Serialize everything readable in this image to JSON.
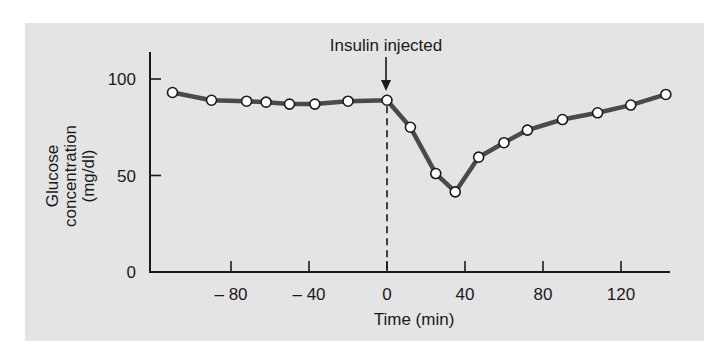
{
  "chart_data": {
    "type": "line",
    "title": "",
    "xlabel": "Time (min)",
    "ylabel": [
      "Glucose",
      "concentration",
      "(mg/dl)"
    ],
    "xlim": [
      -118,
      145
    ],
    "ylim": [
      0,
      117
    ],
    "x_ticks": [
      -80,
      -40,
      0,
      40,
      80,
      120
    ],
    "x_tick_labels": [
      "– 80",
      "– 40",
      "0",
      "40",
      "80",
      "120"
    ],
    "y_ticks": [
      0,
      50,
      100
    ],
    "y_tick_labels": [
      "0",
      "50",
      "100"
    ],
    "grid": false,
    "legend": null,
    "annotations": [
      {
        "text": "Insulin injected",
        "x": 0,
        "type": "arrow + dashed vertical line"
      }
    ],
    "series": [
      {
        "name": "Glucose concentration",
        "marker": "open-circle",
        "x": [
          -110,
          -90,
          -72,
          -62,
          -50,
          -37,
          -20,
          0,
          12,
          25,
          35,
          47,
          60,
          72,
          90,
          108,
          125,
          143
        ],
        "values": [
          93,
          89,
          88.5,
          88,
          87,
          87,
          88.5,
          89,
          75,
          51,
          41.5,
          59.5,
          67,
          73.5,
          79,
          82.5,
          86.5,
          92
        ]
      }
    ]
  },
  "labels": {
    "annotation": "Insulin injected",
    "xlabel": "Time (min)",
    "ylabel_line1": "Glucose",
    "ylabel_line2": "concentration",
    "ylabel_line3": "(mg/dl)"
  },
  "colors": {
    "panel_bg": "#e4e4e4",
    "line": "#4a4a4a",
    "axis": "#1a1a1a",
    "marker_fill": "#ffffff",
    "marker_stroke": "#1a1a1a"
  }
}
